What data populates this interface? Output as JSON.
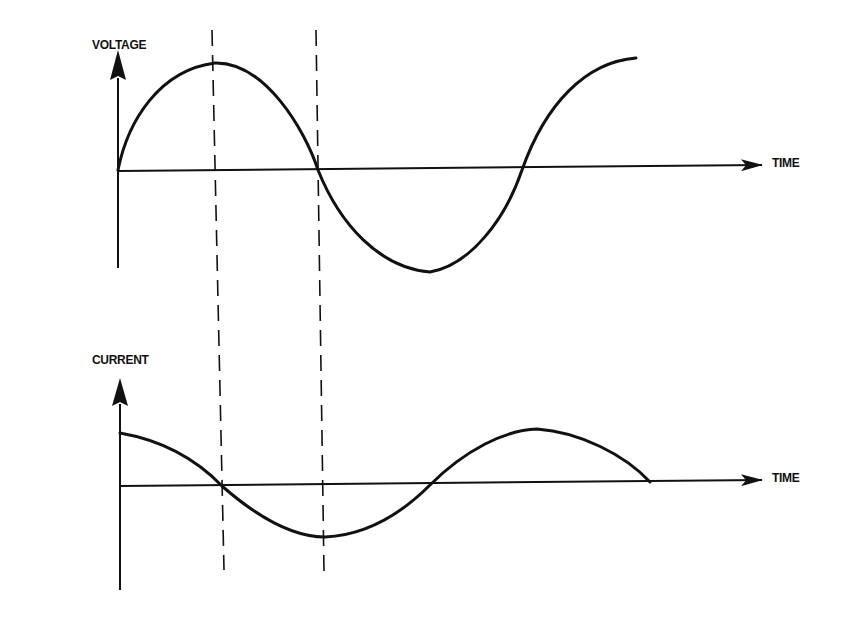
{
  "diagram": {
    "top_panel": {
      "y_label": "VOLTAGE",
      "x_label": "TIME",
      "waveform": "sine"
    },
    "bottom_panel": {
      "y_label": "CURRENT",
      "x_label": "TIME",
      "waveform": "cosine (leading voltage by 90°)"
    },
    "guides": "two vertical dashed lines aligning voltage peak/zero with current zero/trough"
  },
  "colors": {
    "ink": "#111111",
    "background": "#ffffff"
  }
}
